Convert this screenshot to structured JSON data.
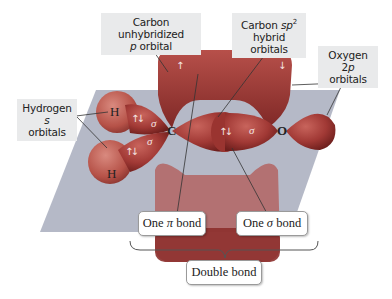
{
  "labels": {
    "carbon_p": {
      "line1": "Carbon unhybridized",
      "line2_italic": "p",
      "line2_rest": " orbital"
    },
    "carbon_sp2": {
      "line1_pre": "Carbon ",
      "line1_italic": "sp",
      "line1_sup": "2",
      "line2": "hybrid orbitals"
    },
    "oxygen_2p": {
      "line1_pre": "Oxygen 2",
      "line1_italic": "p",
      "line2": "orbitals"
    },
    "hydrogen_s": {
      "line1_pre": "Hydrogen ",
      "line1_italic": "s",
      "line2": "orbitals"
    }
  },
  "atoms": {
    "h_top": "H",
    "h_bottom": "H",
    "carbon": "C",
    "oxygen": "O"
  },
  "symbols": {
    "sigma": "σ",
    "spin_pair": "↑↓",
    "spin_up": "↑",
    "spin_down": "↓"
  },
  "bond_boxes": {
    "pi": {
      "pre": "One ",
      "symbol": "π",
      "post": " bond"
    },
    "sigma": {
      "pre": "One ",
      "symbol": "σ",
      "post": " bond"
    },
    "double": "Double bond"
  },
  "colors": {
    "plane": "#a8adbd",
    "orbital": "#a63a36",
    "orbital_dark": "#7d2523",
    "hydrogen": "#b8544c",
    "label_bg": "#e9eaeb"
  }
}
